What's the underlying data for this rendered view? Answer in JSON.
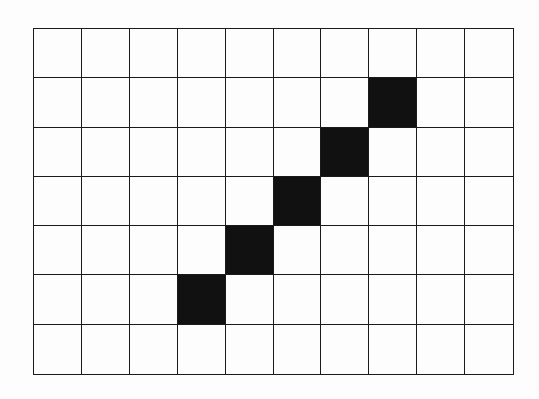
{
  "grid": {
    "columns": 10,
    "rows": 7,
    "line_color": "#1a1a1a",
    "empty_color": "#fdfdfd",
    "filled_color": "#111111",
    "filled_cells": [
      {
        "col": 7,
        "row": 1
      },
      {
        "col": 6,
        "row": 2
      },
      {
        "col": 5,
        "row": 3
      },
      {
        "col": 4,
        "row": 4
      },
      {
        "col": 3,
        "row": 5
      }
    ]
  }
}
